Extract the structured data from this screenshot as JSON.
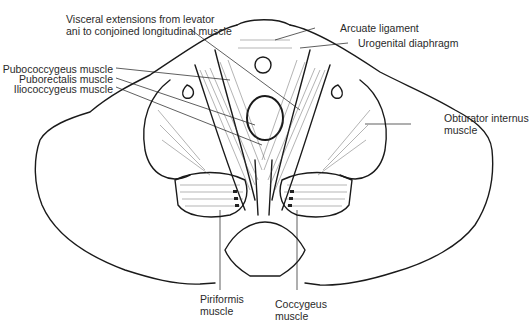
{
  "figure": {
    "labels": {
      "visceral_extensions_1": "Visceral extensions from levator",
      "visceral_extensions_2": "ani to conjoined longitudinal muscle",
      "pubococcygeus": "Pubococcygeus muscle",
      "puborectalis": "Puborectalis muscle",
      "iliococcygeus": "Iliococcygeus muscle",
      "arcuate_ligament": "Arcuate ligament",
      "urogenital_diaphragm": "Urogenital diaphragm",
      "obturator_internus_1": "Obturator internus",
      "obturator_internus_2": "muscle",
      "piriformis_1": "Piriformis",
      "piriformis_2": "muscle",
      "coccygeus_1": "Coccygeus",
      "coccygeus_2": "muscle"
    },
    "colors": {
      "line": "#1a1a1a",
      "text": "#2a2a2a",
      "background": "#ffffff"
    }
  }
}
